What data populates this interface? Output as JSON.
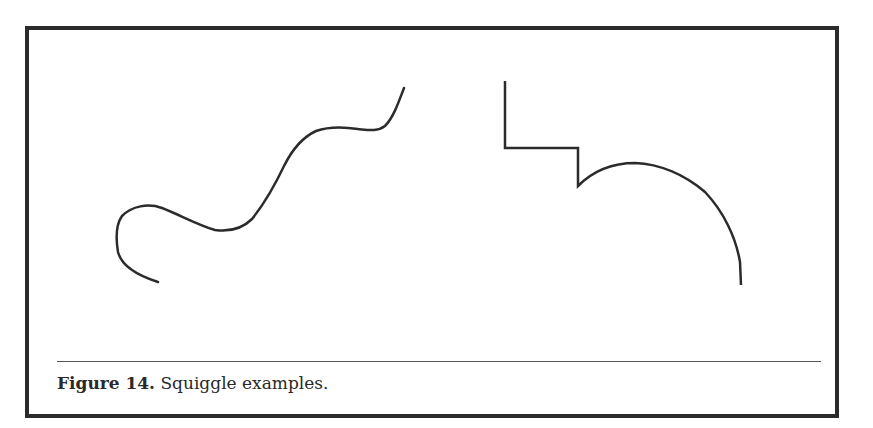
{
  "figure": {
    "label": "Figure 14.",
    "caption": " Squiggle examples.",
    "colors": {
      "border": "#2b2b2b",
      "stroke": "#2b2b2b",
      "rule": "#555555"
    },
    "drawings": [
      {
        "name": "freehand-squiggle",
        "description": "smooth wavy freehand curve"
      },
      {
        "name": "stepped-line-with-arc",
        "description": "right-angle step line followed by a rounded arc"
      }
    ]
  }
}
